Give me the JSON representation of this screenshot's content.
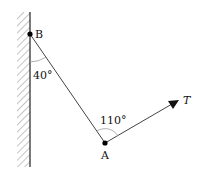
{
  "diagram": {
    "type": "force-diagram",
    "points": {
      "B": {
        "label": "B",
        "x": 30,
        "y": 34
      },
      "A": {
        "label": "A",
        "x": 105,
        "y": 143
      }
    },
    "angles": {
      "at_B": {
        "label": "40°",
        "value": 40
      },
      "at_A": {
        "label": "110°",
        "value": 110
      }
    },
    "force": {
      "label": "T",
      "tip_x": 178,
      "tip_y": 101
    },
    "wall": {
      "x": 30,
      "top": 12,
      "bottom": 167,
      "hatch_width": 13
    },
    "colors": {
      "line": "#333333",
      "hatch": "#888888",
      "point": "#000000"
    }
  }
}
